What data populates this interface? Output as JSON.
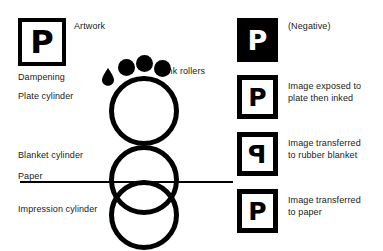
{
  "diagram": {
    "colors": {
      "ink": "#000000",
      "background": "#ffffff",
      "text": "#1a1a1a"
    }
  },
  "artwork": {
    "label": "Artwork",
    "glyph": "P"
  },
  "left_labels": {
    "dampening": "Dampening",
    "plate_cylinder": "Plate cylinder",
    "blanket_cylinder": "Blanket cylinder",
    "paper": "Paper",
    "impression_cylinder": "Impression cylinder",
    "ink_rollers": "Ink rollers"
  },
  "samples": [
    {
      "glyph": "P",
      "mirrored": false,
      "style": "negative",
      "caption": "(Negative)"
    },
    {
      "glyph": "P",
      "mirrored": false,
      "style": "positive",
      "caption": "Image exposed to\nplate then inked"
    },
    {
      "glyph": "P",
      "mirrored": true,
      "style": "positive",
      "caption": "Image transferred\nto rubber blanket"
    },
    {
      "glyph": "P",
      "mirrored": false,
      "style": "positive",
      "caption": "Image transferred\nto paper"
    }
  ],
  "cylinders": [
    {
      "name": "plate-cylinder"
    },
    {
      "name": "blanket-cylinder"
    },
    {
      "name": "impression-cylinder"
    }
  ],
  "ink_rollers_count": 3
}
